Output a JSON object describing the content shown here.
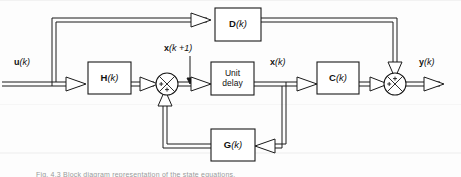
{
  "figure": {
    "type": "block-diagram",
    "caption": "Fig. 4.3 Block diagram representation of the state equations.",
    "line_style": "double-line vector bus with hollow triangular arrowheads",
    "colors": {
      "background": "#fdfdfd",
      "stroke": "#1a1a1a",
      "fill": "#ffffff",
      "caption": "#9a9a9a",
      "scanline": "#e9e9e9"
    }
  },
  "blocks": [
    {
      "id": "D",
      "label_bold": "D",
      "label_arg": "(k)",
      "x": 215,
      "y": 8,
      "w": 46,
      "h": 33
    },
    {
      "id": "H",
      "label_bold": "H",
      "label_arg": "(k)",
      "x": 88,
      "y": 62,
      "w": 43,
      "h": 32
    },
    {
      "id": "UD",
      "label_bold": "",
      "label_arg": "Unit\ndelay",
      "x": 211,
      "y": 62,
      "w": 43,
      "h": 33
    },
    {
      "id": "C",
      "label_bold": "C",
      "label_arg": "(k)",
      "x": 317,
      "y": 62,
      "w": 42,
      "h": 32
    },
    {
      "id": "G",
      "label_bold": "G",
      "label_arg": "(k)",
      "x": 211,
      "y": 129,
      "w": 44,
      "h": 32
    }
  ],
  "block_labels": {
    "D": "D(k)",
    "H": "H(k)",
    "unit_delay": "Unit\ndelay",
    "C": "C(k)",
    "G": "G(k)"
  },
  "summing_junctions": [
    {
      "id": "sum-state",
      "cx": 167,
      "cy": 84,
      "r": 11,
      "signs": [
        "+",
        "+"
      ],
      "sign_positions": [
        "left",
        "bottom"
      ]
    },
    {
      "id": "sum-output",
      "cx": 395,
      "cy": 84,
      "r": 11,
      "signs": [
        "+",
        "+"
      ],
      "sign_positions": [
        "left",
        "top"
      ]
    }
  ],
  "signal_labels": [
    {
      "id": "u",
      "bold": "u",
      "arg": "(k)",
      "text": "u(k)",
      "x": 14,
      "y": 60
    },
    {
      "id": "x-next",
      "bold": "x",
      "arg": "(k +1)",
      "text": "x (k+1)",
      "x": 165,
      "y": 45
    },
    {
      "id": "x",
      "bold": "x",
      "arg": "(k)",
      "text": "x(k)",
      "x": 270,
      "y": 60
    },
    {
      "id": "y",
      "bold": "y",
      "arg": "(k)",
      "text": "y(k)",
      "x": 420,
      "y": 60
    }
  ],
  "connections": [
    {
      "from": "u-input",
      "to": "H",
      "name": "input-to-H"
    },
    {
      "from": "u-branch",
      "to": "D",
      "name": "input-to-D"
    },
    {
      "from": "H",
      "to": "sum-state",
      "name": "H-to-summer"
    },
    {
      "from": "sum-state",
      "to": "unit-delay",
      "name": "summer-to-unit-delay"
    },
    {
      "from": "unit-delay",
      "to": "C",
      "name": "state-to-C"
    },
    {
      "from": "unit-delay",
      "to": "G",
      "name": "state-to-G"
    },
    {
      "from": "G",
      "to": "sum-state",
      "name": "G-feedback-to-summer"
    },
    {
      "from": "C",
      "to": "sum-output",
      "name": "C-to-output-summer"
    },
    {
      "from": "D",
      "to": "sum-output",
      "name": "D-to-output-summer"
    },
    {
      "from": "sum-output",
      "to": "y-output",
      "name": "output-y"
    }
  ]
}
